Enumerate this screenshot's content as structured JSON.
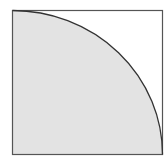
{
  "diagram": {
    "title": "",
    "shapes": [
      {
        "type": "square",
        "label": ""
      },
      {
        "type": "quarter-circle",
        "label": "",
        "fill": "#e3e3e3"
      }
    ],
    "colors": {
      "background": "#ffffff",
      "stroke": "#333333",
      "fill": "#e3e3e3"
    }
  }
}
